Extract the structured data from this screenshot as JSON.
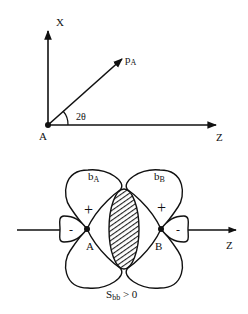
{
  "top_diagram": {
    "axis_x_label": "X",
    "axis_z_label": "Z",
    "origin_label": "A",
    "vector_label": "p",
    "vector_subscript": "A",
    "angle_label": "2θ"
  },
  "bottom_diagram": {
    "orbital_a_label": "b",
    "orbital_a_subscript": "A",
    "orbital_b_label": "b",
    "orbital_b_subscript": "B",
    "atom_a_label": "A",
    "atom_b_label": "B",
    "lobe_a_large_sign": "+",
    "lobe_a_small_sign": "-",
    "lobe_b_large_sign": "+",
    "lobe_b_small_sign": "-",
    "axis_label": "Z",
    "caption_main": "S",
    "caption_subscript": "bb",
    "caption_rest": " > 0"
  }
}
